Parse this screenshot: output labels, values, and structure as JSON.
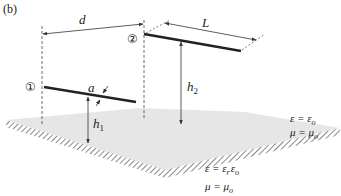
{
  "figure": {
    "panel_label": "(b)",
    "wire1": {
      "marker": "①",
      "radius_label": "a",
      "height_label": "h",
      "height_sub": "1"
    },
    "wire2": {
      "marker": "②",
      "height_label": "h",
      "height_sub": "2"
    },
    "separation_label": "d",
    "length_label": "L",
    "upper_medium": {
      "eps_line": "ε = ε",
      "eps_sub": "o",
      "mu_line": "μ = μ",
      "mu_sub": "o"
    },
    "lower_medium": {
      "eps_line": "ε = ε",
      "eps_sub1": "r",
      "eps_mid": "ε",
      "eps_sub2": "o",
      "mu_line": "μ = μ",
      "mu_sub": "o"
    },
    "colors": {
      "ground_fill": "#e6e6e6",
      "hatch": "#555555",
      "wire": "#222222",
      "dim_line": "#333333"
    }
  }
}
